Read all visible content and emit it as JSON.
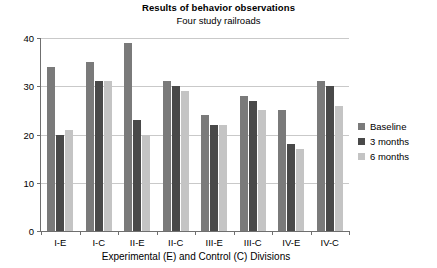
{
  "chart_data": {
    "type": "bar",
    "title": "Results of behavior observations",
    "subtitle": "Four study railroads",
    "xlabel": "Experimental (E) and Control (C) Divisions",
    "ylabel": "",
    "ylim": [
      0,
      40
    ],
    "yticks": [
      0,
      10,
      20,
      30,
      40
    ],
    "grid": true,
    "legend_position": "right",
    "categories": [
      "I-E",
      "I-C",
      "II-E",
      "II-C",
      "III-E",
      "III-C",
      "IV-E",
      "IV-C"
    ],
    "series": [
      {
        "name": "Baseline",
        "color": "#7a7a7a",
        "values": [
          34,
          35,
          39,
          31,
          24,
          28,
          25,
          31
        ]
      },
      {
        "name": "3 months",
        "color": "#494949",
        "values": [
          20,
          31,
          23,
          30,
          22,
          27,
          18,
          30
        ]
      },
      {
        "name": "6 months",
        "color": "#c4c4c4",
        "values": [
          21,
          31,
          20,
          29,
          22,
          25,
          17,
          26
        ]
      }
    ]
  }
}
